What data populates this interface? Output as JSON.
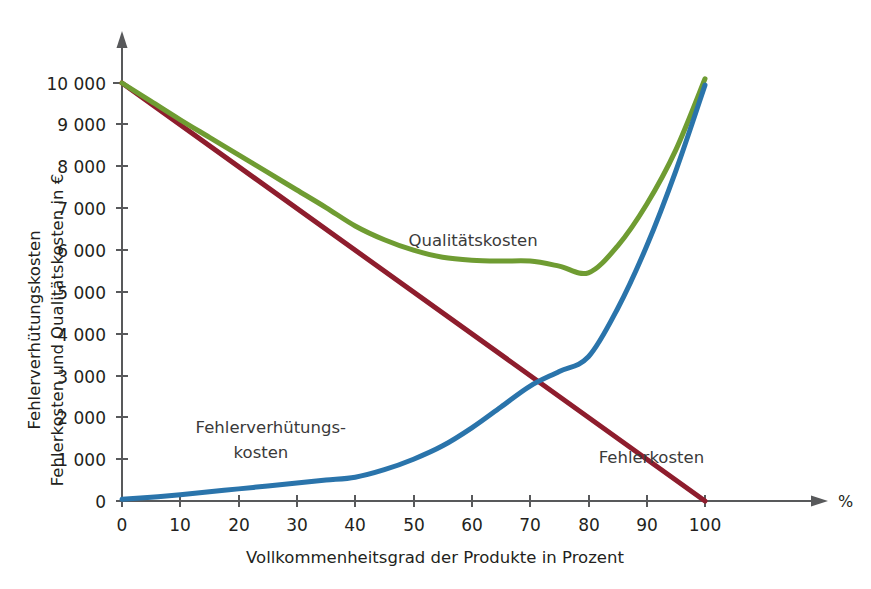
{
  "chart_data": {
    "type": "line",
    "title": "",
    "xlabel": "Vollkommenheitsgrad der Produkte in Prozent",
    "ylabel_line1": "Fehlerverhütungskosten",
    "ylabel_line2": "Fehlerkosten und Qualitätskosten in €",
    "x_unit": "%",
    "xlim": [
      0,
      100
    ],
    "ylim": [
      0,
      10500
    ],
    "grid": false,
    "legend_position": "inline-annotations",
    "x_ticks": [
      0,
      10,
      20,
      30,
      40,
      50,
      60,
      70,
      80,
      90,
      100
    ],
    "x_tick_labels": [
      "0",
      "10",
      "20",
      "30",
      "40",
      "50",
      "60",
      "70",
      "80",
      "90",
      "100"
    ],
    "y_ticks": [
      0,
      1000,
      2000,
      3000,
      4000,
      5000,
      6000,
      7000,
      8000,
      9000,
      10000
    ],
    "y_tick_labels": [
      "0",
      "1 000",
      "2 000",
      "3 000",
      "4 000",
      "5 000",
      "6 000",
      "7 000",
      "8 000",
      "9 000",
      "10 000"
    ],
    "x": [
      0,
      5,
      10,
      15,
      20,
      25,
      30,
      35,
      40,
      45,
      50,
      55,
      60,
      65,
      70,
      75,
      80,
      85,
      90,
      95,
      100
    ],
    "series": [
      {
        "name": "Fehlerkosten",
        "color": "#8e1d2d",
        "values": [
          10000,
          9500,
          9000,
          8500,
          8000,
          7500,
          7000,
          6500,
          6000,
          5500,
          5000,
          4500,
          4000,
          3500,
          3000,
          2500,
          2000,
          1500,
          1000,
          500,
          0
        ]
      },
      {
        "name": "Fehlerverhütungskosten",
        "color": "#2a74ab",
        "values": [
          40,
          90,
          150,
          220,
          290,
          360,
          430,
          500,
          570,
          750,
          1000,
          1320,
          1750,
          2250,
          2750,
          3100,
          3450,
          4600,
          6100,
          7900,
          9950
        ]
      },
      {
        "name": "Qualitätskosten",
        "color": "#6f9c32",
        "values": [
          10000,
          9560,
          9120,
          8700,
          8280,
          7860,
          7440,
          7020,
          6580,
          6250,
          6000,
          5830,
          5760,
          5740,
          5740,
          5620,
          5460,
          6100,
          7100,
          8400,
          10100
        ]
      }
    ],
    "annotations": [
      {
        "name": "Qualitätskosten",
        "text": "Qualitätskosten",
        "x_pct": 62,
        "y_value": 6100
      },
      {
        "name": "Fehlerverhütungskosten",
        "line1": "Fehlerverhütungs-",
        "line2": "kosten",
        "x_pct": 26,
        "y_value": 1350
      },
      {
        "name": "Fehlerkosten",
        "text": "Fehlerkosten",
        "x_pct": 90,
        "y_value": 900
      }
    ]
  },
  "axes": {
    "y_axis_name": "vertical-value-axis",
    "x_axis_name": "horizontal-percent-axis"
  }
}
